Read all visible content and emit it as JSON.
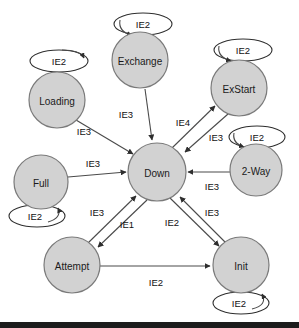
{
  "diagram": {
    "node_fill_color": "#d2d2d2",
    "node_stroke_color": "#7a7a7a",
    "edge_color": "#4a4a4a",
    "loop_fill_color": "#ffffff",
    "background_color": "#ffffff",
    "bottom_bar_color": "#1c1c1c"
  },
  "nodes": [
    {
      "id": "exchange",
      "label": "Exchange",
      "cx": 140,
      "cy": 60,
      "r": 28
    },
    {
      "id": "loading",
      "label": "Loading",
      "cx": 57,
      "cy": 100,
      "r": 28
    },
    {
      "id": "exstart",
      "label": "ExStart",
      "cx": 239,
      "cy": 88,
      "r": 28
    },
    {
      "id": "twoway",
      "label": "2-Way",
      "cx": 256,
      "cy": 170,
      "r": 26
    },
    {
      "id": "full",
      "label": "Full",
      "cx": 41,
      "cy": 182,
      "r": 27
    },
    {
      "id": "down",
      "label": "Down",
      "cx": 157,
      "cy": 172,
      "r": 29
    },
    {
      "id": "attempt",
      "label": "Attempt",
      "cx": 72,
      "cy": 265,
      "r": 28
    },
    {
      "id": "init",
      "label": "Init",
      "cx": 241,
      "cy": 265,
      "r": 28
    }
  ],
  "self_loops": [
    {
      "id": "loop-exchange",
      "node": "exchange",
      "label": "IE2",
      "cx": 143,
      "cy": 24,
      "rx": 29,
      "ry": 11
    },
    {
      "id": "loop-loading",
      "node": "loading",
      "label": "IE2",
      "cx": 59,
      "cy": 61,
      "rx": 29,
      "ry": 11
    },
    {
      "id": "loop-exstart",
      "node": "exstart",
      "label": "IE2",
      "cx": 243,
      "cy": 50,
      "rx": 29,
      "ry": 11
    },
    {
      "id": "loop-twoway",
      "node": "twoway",
      "label": "IE2",
      "cx": 257,
      "cy": 137,
      "rx": 28,
      "ry": 11
    },
    {
      "id": "loop-full",
      "node": "full",
      "label": "IE2",
      "cx": 37,
      "cy": 216,
      "rx": 28,
      "ry": 11
    },
    {
      "id": "loop-init",
      "node": "init",
      "label": "IE2",
      "cx": 241,
      "cy": 303,
      "rx": 28,
      "ry": 11
    }
  ],
  "edges": [
    {
      "id": "loading-down",
      "from": "loading",
      "to": "down",
      "label": "IE3",
      "label_x": 84,
      "label_y": 131
    },
    {
      "id": "exchange-down",
      "from": "exchange",
      "to": "down",
      "label": "IE3",
      "label_x": 126,
      "label_y": 114
    },
    {
      "id": "down-exstart",
      "from": "down",
      "to": "exstart",
      "label": "IE4",
      "label_x": 183,
      "label_y": 122
    },
    {
      "id": "exstart-down",
      "from": "exstart",
      "to": "down",
      "label": "IE3",
      "label_x": 215,
      "label_y": 136
    },
    {
      "id": "full-down",
      "from": "full",
      "to": "down",
      "label": "IE3",
      "label_x": 93,
      "label_y": 165
    },
    {
      "id": "twoway-down",
      "from": "twoway",
      "to": "down",
      "label": "IE3",
      "label_x": 212,
      "label_y": 184
    },
    {
      "id": "attempt-down",
      "from": "attempt",
      "to": "down",
      "label": "IE3",
      "label_x": 97,
      "label_y": 212
    },
    {
      "id": "down-attempt",
      "from": "down",
      "to": "attempt",
      "label": "IE1",
      "label_x": 127,
      "label_y": 224
    },
    {
      "id": "down-init",
      "from": "down",
      "to": "init",
      "label": "IE2",
      "label_x": 172,
      "label_y": 222
    },
    {
      "id": "init-down",
      "from": "init",
      "to": "down",
      "label": "IE3",
      "label_x": 211,
      "label_y": 212
    },
    {
      "id": "attempt-init",
      "from": "attempt",
      "to": "init",
      "label": "IE2",
      "label_x": 156,
      "label_y": 281
    }
  ]
}
